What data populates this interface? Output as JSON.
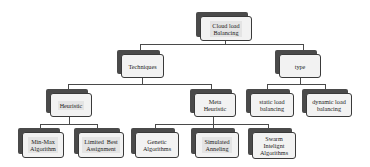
{
  "diagram": {
    "type": "tree",
    "root": {
      "label": "Cloud load Balancing",
      "children": [
        "Techniques",
        "type"
      ]
    },
    "nodes": {
      "root": {
        "lines": [
          "Cloud load",
          "Balancing"
        ]
      },
      "techniques": {
        "lines": [
          "Techniques"
        ]
      },
      "type": {
        "lines": [
          "type"
        ]
      },
      "heuristic": {
        "lines": [
          "Heuristic"
        ]
      },
      "meta_heuristic": {
        "lines": [
          "Meta",
          "Heuristic"
        ]
      },
      "static_lb": {
        "lines": [
          "static load",
          "balancing"
        ]
      },
      "dynamic_lb": {
        "lines": [
          "dynamic load",
          "balancing"
        ]
      },
      "min_max": {
        "lines": [
          "Min-Max",
          "Algorithm"
        ]
      },
      "limited_best": {
        "lines": [
          "Limited  Best",
          "Assignment"
        ]
      },
      "genetic": {
        "lines": [
          "Genetic",
          "Algorithms"
        ]
      },
      "simulated": {
        "lines": [
          "Simulated",
          "Anneling"
        ]
      },
      "swarm": {
        "lines": [
          "Swarm",
          "Intelignt",
          "Algorithms"
        ]
      }
    },
    "edges": [
      [
        "Cloud load Balancing",
        "Techniques"
      ],
      [
        "Cloud load Balancing",
        "type"
      ],
      [
        "Techniques",
        "Heuristic"
      ],
      [
        "Techniques",
        "Meta Heuristic"
      ],
      [
        "type",
        "static load balancing"
      ],
      [
        "type",
        "dynamic load balancing"
      ],
      [
        "Heuristic",
        "Min-Max Algorithm"
      ],
      [
        "Heuristic",
        "Limited Best Assignment"
      ],
      [
        "Meta Heuristic",
        "Genetic Algorithms"
      ],
      [
        "Meta Heuristic",
        "Simulated Anneling"
      ],
      [
        "Meta Heuristic",
        "Swarm Intelignt Algorithms"
      ]
    ]
  },
  "colors": {
    "shadow": "#4a4a4a",
    "box_fill": "#f2f2f2",
    "connector": "#4a4a4a"
  }
}
